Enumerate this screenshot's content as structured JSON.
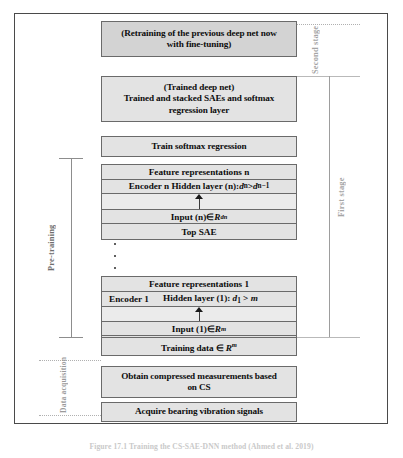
{
  "figure": {
    "caption": "Figure 17.1 Training the CS-SAE-DNN method (Ahmed et al. 2019)",
    "frame_color": "#4a4a4a",
    "box_fill": "#e3e3e3",
    "box_border": "#6a6a6a",
    "label_color": "#9a9a9a"
  },
  "stages": {
    "second": "Second stage",
    "first": "First stage",
    "pretraining": "Pre-training",
    "data_acquisition": "Data acquisition"
  },
  "blocks": {
    "retrain": {
      "line1": "(Retraining of the previous deep net now",
      "line2": "with fine-tuning)"
    },
    "trained_deep_net": {
      "line1": "(Trained deep net)",
      "line2": "Trained and stacked SAEs and softmax",
      "line3": "regression layer"
    },
    "train_softmax": {
      "label": "Train softmax regression"
    },
    "training_data": {
      "prefix": "Training data ",
      "member": "∈ ",
      "space": "R",
      "exponent": "m"
    },
    "obtain_cs": {
      "line1": "Obtain compressed measurements based",
      "line2": "on CS"
    },
    "acquire": {
      "label": "Acquire bearing vibration signals"
    }
  },
  "top_sae": {
    "name": "Top SAE",
    "rows": {
      "features": "Feature representations n",
      "encoder_label": "Encoder n",
      "hidden_label": "Hidden layer (n): ",
      "hidden_lhs": "d",
      "hidden_lhs_sub": "n",
      "hidden_rel": " > ",
      "hidden_rhs": "d",
      "hidden_rhs_sub": "n−1",
      "input_prefix": "Input (n) ",
      "input_member": "∈ ",
      "input_space": "R",
      "input_exponent": "d",
      "input_exponent_sub": "n"
    }
  },
  "first_sae": {
    "name": "First SAE",
    "rows": {
      "features": "Feature representations 1",
      "encoder_label": "Encoder 1",
      "hidden_label": "Hidden layer (1): ",
      "hidden_lhs": "d",
      "hidden_lhs_sub": "1",
      "hidden_rel": " > ",
      "hidden_rhs": "m",
      "input_prefix": "Input (1) ",
      "input_member": "∈ ",
      "input_space": "R",
      "input_exponent": "m"
    }
  },
  "connectors": {
    "arrow": "up-arrow",
    "dots": "vertical-ellipsis"
  }
}
